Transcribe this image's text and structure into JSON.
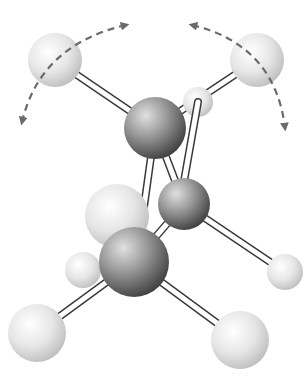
{
  "diagram": {
    "colors": {
      "background": "#ffffff",
      "carbon_light": "#d8d8d8",
      "carbon_dark": "#4a4a4a",
      "hydrogen_light": "#ffffff",
      "hydrogen_dark": "#c4c4c4",
      "bond_stroke": "#3a3a3a",
      "bond_fill": "#ffffff",
      "arrow": "#6a6a6a"
    },
    "atoms": [
      {
        "id": "h-top-left",
        "type": "hydrogen",
        "cx": 55,
        "cy": 60,
        "r": 27
      },
      {
        "id": "h-top-right",
        "type": "hydrogen",
        "cx": 257,
        "cy": 60,
        "r": 27
      },
      {
        "id": "h-back-small",
        "type": "hydrogen",
        "cx": 198,
        "cy": 102,
        "r": 15
      },
      {
        "id": "c-upper",
        "type": "carbon",
        "cx": 155,
        "cy": 128,
        "r": 31
      },
      {
        "id": "c-mid-right",
        "type": "carbon",
        "cx": 184,
        "cy": 204,
        "r": 26
      },
      {
        "id": "h-right-small",
        "type": "hydrogen",
        "cx": 285,
        "cy": 272,
        "r": 18
      },
      {
        "id": "h-left-small",
        "type": "hydrogen",
        "cx": 83,
        "cy": 270,
        "r": 18
      },
      {
        "id": "h-mid-left-large",
        "type": "hydrogen",
        "cx": 117,
        "cy": 216,
        "r": 32
      },
      {
        "id": "c-lower",
        "type": "carbon",
        "cx": 134,
        "cy": 262,
        "r": 35
      },
      {
        "id": "h-bottom-left",
        "type": "hydrogen",
        "cx": 37,
        "cy": 333,
        "r": 29
      },
      {
        "id": "h-bottom-right",
        "type": "hydrogen",
        "cx": 240,
        "cy": 340,
        "r": 29
      }
    ],
    "bonds": [
      {
        "from": [
          55,
          60
        ],
        "to": [
          155,
          128
        ]
      },
      {
        "from": [
          257,
          60
        ],
        "to": [
          155,
          128
        ]
      },
      {
        "from": [
          198,
          102
        ],
        "to": [
          180,
          204
        ]
      },
      {
        "from": [
          155,
          128
        ],
        "to": [
          184,
          204
        ]
      },
      {
        "from": [
          155,
          128
        ],
        "to": [
          138,
          250
        ]
      },
      {
        "from": [
          184,
          204
        ],
        "to": [
          285,
          272
        ]
      },
      {
        "from": [
          184,
          204
        ],
        "to": [
          134,
          262
        ]
      },
      {
        "from": [
          134,
          262
        ],
        "to": [
          37,
          333
        ]
      },
      {
        "from": [
          134,
          262
        ],
        "to": [
          240,
          340
        ]
      }
    ],
    "arrows": [
      {
        "id": "rotation-arrow-left",
        "path": "M 126 25 Q 40 45 22 122"
      },
      {
        "id": "rotation-arrow-right",
        "path": "M 192 25 Q 275 45 285 128"
      }
    ]
  }
}
